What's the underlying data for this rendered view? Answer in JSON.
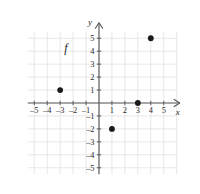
{
  "chart_data": {
    "type": "scatter",
    "title": "",
    "xlabel": "x",
    "ylabel": "y",
    "function_label": "f",
    "grid": true,
    "legend": "none",
    "xlim": [
      -5.5,
      6.0
    ],
    "ylim": [
      -5.5,
      5.5
    ],
    "xticks": [
      -5,
      -4,
      -3,
      -2,
      -1,
      1,
      2,
      3,
      4,
      5
    ],
    "yticks": [
      5,
      4,
      3,
      2,
      1,
      -1,
      -2,
      -3,
      -4,
      -5
    ],
    "xtick_labels": [
      "–5",
      "–4",
      "–3",
      "–2",
      "–1",
      "1",
      "2",
      "3",
      "4",
      "5"
    ],
    "ytick_labels": [
      "5",
      "4",
      "3",
      "2",
      "1",
      "–1",
      "–2",
      "–3",
      "–4",
      "–5"
    ],
    "points": [
      {
        "x": -3,
        "y": 1,
        "label": "(–3, 1)"
      },
      {
        "x": 1,
        "y": -2,
        "label": "(1, –2)"
      },
      {
        "x": 3,
        "y": 0,
        "label": "(3, 0)"
      },
      {
        "x": 4,
        "y": 5,
        "label": "(4, 5)"
      }
    ],
    "point_color": "#1a1a1a",
    "grid_color": "#dcdcdc",
    "axis_color": "#5a5a5a",
    "background": "#ffffff"
  },
  "annotations": {
    "function_label": "f",
    "function_label_x": -2.55,
    "function_label_y": 3.95
  }
}
